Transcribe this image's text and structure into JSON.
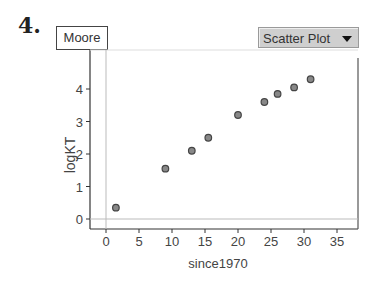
{
  "question_number": "4.",
  "title_box": "Moore",
  "plot_selector": {
    "label": "Scatter Plot",
    "icon": "triangle-down-icon"
  },
  "chart_data": {
    "type": "scatter",
    "title": "Moore",
    "xlabel": "since1970",
    "ylabel": "logKT",
    "xlim": [
      -2.5,
      37.5
    ],
    "ylim": [
      -0.3,
      4.6
    ],
    "x_ticks": [
      0,
      5,
      10,
      15,
      20,
      25,
      30,
      35
    ],
    "y_ticks": [
      0,
      1,
      2,
      3,
      4
    ],
    "grid": false,
    "reference_lines": {
      "x": 0,
      "y": 0
    },
    "series": [
      {
        "name": "Moore",
        "x": [
          1.5,
          9,
          13,
          15.5,
          20,
          24,
          26,
          28.5,
          31
        ],
        "y": [
          0.35,
          1.55,
          2.1,
          2.5,
          3.2,
          3.6,
          3.85,
          4.05,
          4.3
        ]
      }
    ]
  }
}
